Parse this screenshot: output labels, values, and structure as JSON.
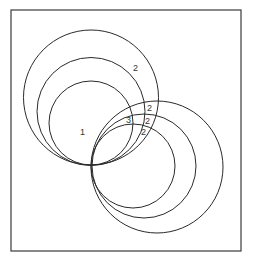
{
  "diagram": {
    "frame": {
      "x": 11,
      "y": 10,
      "width": 230,
      "height": 241
    },
    "tangent_point": {
      "x": 91,
      "y": 165
    },
    "upper_left_circles": [
      {
        "cx": 91,
        "cy": 97.5,
        "r": 67.5
      },
      {
        "cx": 91,
        "cy": 111.5,
        "r": 54
      },
      {
        "cx": 91,
        "cy": 123,
        "r": 42
      }
    ],
    "lower_right_circles": [
      {
        "cx": 133,
        "cy": 166,
        "r": 42
      },
      {
        "cx": 144,
        "cy": 166,
        "r": 52
      },
      {
        "cx": 157,
        "cy": 167,
        "r": 66
      }
    ],
    "labels": [
      {
        "text": "1",
        "x": 80,
        "y": 135
      },
      {
        "text": "2",
        "x": 133,
        "y": 71
      },
      {
        "text": "2",
        "x": 147,
        "y": 111
      },
      {
        "text": "3",
        "x": 126,
        "y": 123
      },
      {
        "text": "2",
        "x": 145,
        "y": 124
      },
      {
        "text": "2",
        "x": 141,
        "y": 135
      }
    ]
  }
}
